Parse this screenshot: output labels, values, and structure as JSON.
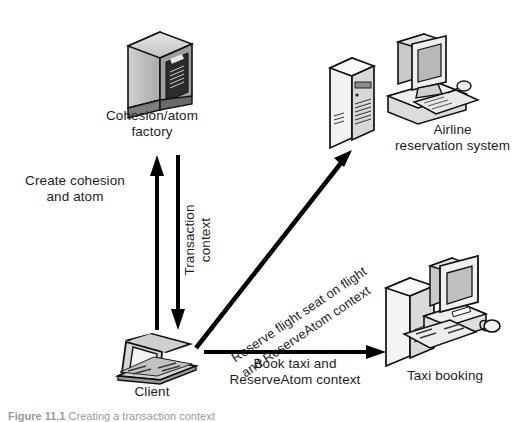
{
  "diagram": {
    "background_color": "#ffffff",
    "line_color": "#000000",
    "text_color": "#1d1d1d"
  },
  "nodes": [
    {
      "id": "factory",
      "label": "Cohesion/atom\nfactory",
      "icon": "server-cabinet-icon"
    },
    {
      "id": "airline",
      "label": "Airline\nreservation system",
      "icon": "server-and-desktop-icon"
    },
    {
      "id": "taxi",
      "label": "Taxi booking",
      "icon": "desktop-computer-icon"
    },
    {
      "id": "client",
      "label": "Client",
      "icon": "laptop-icon"
    }
  ],
  "edges": [
    {
      "id": "create",
      "label": "Create cohesion\nand atom",
      "from": "client",
      "to": "factory",
      "direction": "up"
    },
    {
      "id": "transaction",
      "label": "Transaction\ncontext",
      "from": "factory",
      "to": "client",
      "direction": "down"
    },
    {
      "id": "reserve",
      "label": "Reserve flight seat on flight\nand ReserveAtom context",
      "from": "client",
      "to": "airline",
      "direction": "up-right"
    },
    {
      "id": "book",
      "label": "Book taxi and\nReserveAtom context",
      "from": "client",
      "to": "taxi",
      "direction": "right"
    }
  ],
  "caption": {
    "prefix": "Figure 11.1",
    "text": "Creating a transaction context"
  }
}
